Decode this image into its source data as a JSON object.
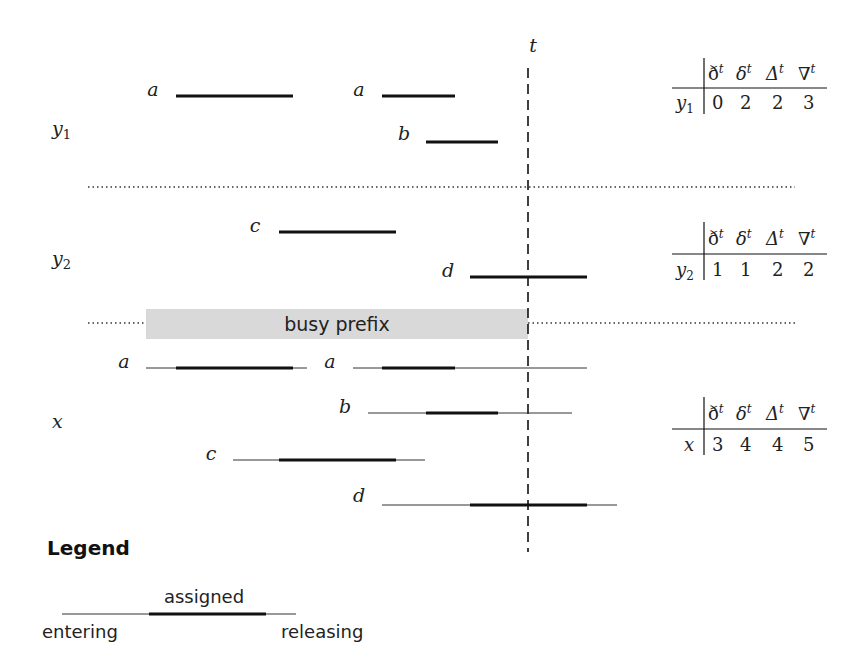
{
  "diagram": {
    "time_marker": {
      "label": "t",
      "x": 528
    },
    "rows": [
      {
        "id": "y1",
        "label": "y",
        "subscript": "1",
        "label_y": 130
      },
      {
        "id": "y2",
        "label": "y",
        "subscript": "2",
        "label_y": 265
      },
      {
        "id": "x",
        "label": "x",
        "subscript": "",
        "label_y": 428
      }
    ],
    "separators": [
      {
        "y": 187
      },
      {
        "y": 323
      }
    ],
    "busy_prefix": {
      "label": "busy prefix",
      "x1": 146,
      "x2": 528,
      "y": 309,
      "height": 30,
      "color": "#d9d9d9"
    },
    "intervals": {
      "y1": [
        {
          "name": "a",
          "label_x": 153,
          "y": 96,
          "assigned": [
            176,
            293
          ]
        },
        {
          "name": "a",
          "label_x": 359,
          "y": 96,
          "assigned": [
            382,
            455
          ]
        },
        {
          "name": "b",
          "label_x": 404,
          "y": 142,
          "assigned": [
            426,
            498
          ]
        }
      ],
      "y2": [
        {
          "name": "c",
          "label_x": 255,
          "y": 232,
          "assigned": [
            279,
            396
          ]
        },
        {
          "name": "d",
          "label_x": 448,
          "y": 277,
          "assigned": [
            470,
            587
          ]
        }
      ],
      "x": [
        {
          "name": "a",
          "label_x": 124,
          "y": 368,
          "span": [
            146,
            307
          ],
          "assigned": [
            176,
            293
          ]
        },
        {
          "name": "a",
          "label_x": 330,
          "y": 368,
          "span": [
            353,
            587
          ],
          "assigned": [
            382,
            455
          ]
        },
        {
          "name": "b",
          "label_x": 345,
          "y": 413,
          "span": [
            368,
            572
          ],
          "assigned": [
            426,
            498
          ]
        },
        {
          "name": "c",
          "label_x": 211,
          "y": 460,
          "span": [
            233,
            425
          ],
          "assigned": [
            279,
            396
          ]
        },
        {
          "name": "d",
          "label_x": 359,
          "y": 505,
          "span": [
            382,
            617
          ],
          "assigned": [
            470,
            587
          ]
        }
      ]
    }
  },
  "tables": {
    "headers": [
      "ð",
      "δ",
      "Δ",
      "∇"
    ],
    "header_superscript": "t",
    "rows": [
      {
        "row_label": "y",
        "row_sub": "1",
        "values": [
          "0",
          "2",
          "2",
          "3"
        ],
        "top": 58
      },
      {
        "row_label": "y",
        "row_sub": "2",
        "values": [
          "1",
          "1",
          "2",
          "2"
        ],
        "top": 222
      },
      {
        "row_label": "x",
        "row_sub": "",
        "values": [
          "3",
          "4",
          "4",
          "5"
        ],
        "top": 397
      }
    ]
  },
  "legend": {
    "title": "Legend",
    "assigned_label": "assigned",
    "entering_label": "entering",
    "releasing_label": "releasing"
  },
  "colors": {
    "line": "#111111",
    "thin_line": "#333333",
    "busy_fill": "#d9d9d9",
    "dotted": "#333333"
  }
}
